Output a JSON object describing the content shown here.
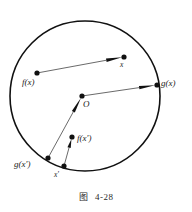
{
  "figure": {
    "caption_label": "图",
    "caption_number": "4-28",
    "colors": {
      "stroke": "#111111",
      "line": "#444444",
      "background": "#ffffff",
      "label": "#1a1a1a"
    },
    "circle": {
      "name": "boundary-circle",
      "cx": 85,
      "cy": 96,
      "r": 75,
      "stroke_width": 1.6
    },
    "points": [
      {
        "id": "x",
        "label": "x",
        "cx": 124,
        "cy": 57,
        "r": 2.6,
        "label_x": 120,
        "label_y": 61
      },
      {
        "id": "fx",
        "label": "f(x)",
        "cx": 37,
        "cy": 73,
        "r": 2.6,
        "label_x": 22,
        "label_y": 78
      },
      {
        "id": "O",
        "label": "O",
        "cx": 82,
        "cy": 96,
        "r": 2.6,
        "label_x": 83,
        "label_y": 100
      },
      {
        "id": "gx",
        "label": "g(x)",
        "cx": 157,
        "cy": 85,
        "r": 2.6,
        "label_x": 161,
        "label_y": 79
      },
      {
        "id": "fxp",
        "label": "f(x')",
        "cx": 72,
        "cy": 137,
        "r": 2.6,
        "label_x": 77,
        "label_y": 134
      },
      {
        "id": "xp",
        "label": "x'",
        "cx": 64,
        "cy": 166,
        "r": 2.6,
        "label_x": 54,
        "label_y": 171
      },
      {
        "id": "gxp",
        "label": "g(x')",
        "cx": 48,
        "cy": 158,
        "r": 2.6,
        "label_x": 14,
        "label_y": 160
      }
    ],
    "vectors": [
      {
        "id": "fx-to-x",
        "name": "arrow-fx-to-x",
        "x1": 37,
        "y1": 73,
        "x2": 124,
        "y2": 57
      },
      {
        "id": "O-to-gx",
        "name": "arrow-O-to-gx",
        "x1": 82,
        "y1": 96,
        "x2": 157,
        "y2": 85
      },
      {
        "id": "xp-to-fxp",
        "name": "arrow-xp-to-fxp",
        "x1": 64,
        "y1": 166,
        "x2": 72,
        "y2": 137
      },
      {
        "id": "gxp-to-O",
        "name": "arrow-gxp-to-up",
        "x1": 48,
        "y1": 158,
        "x2": 82,
        "y2": 96
      }
    ]
  }
}
